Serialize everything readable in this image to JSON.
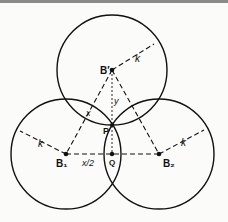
{
  "diagram": {
    "labels": {
      "b_prime": "B′",
      "b1": "B₁",
      "b2": "B₂",
      "p": "P",
      "q": "Q",
      "k_top": "k",
      "k_left": "k",
      "k_right": "k",
      "x": "x",
      "y": "y",
      "x_half": "x/2"
    },
    "colors": {
      "stroke": "#111111",
      "topbar": "#8a8a8a"
    }
  }
}
